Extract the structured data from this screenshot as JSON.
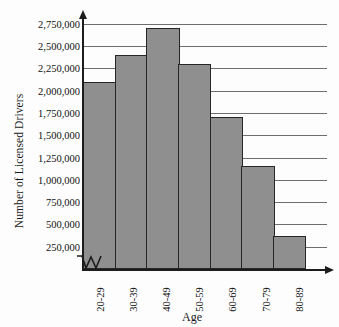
{
  "chart_data": {
    "type": "bar",
    "title": "",
    "xlabel": "Age",
    "ylabel": "Number of Licensed Drivers",
    "categories": [
      "20-29",
      "30-39",
      "40-49",
      "50-59",
      "60-69",
      "70-79",
      "80-89"
    ],
    "values": [
      2100000,
      2400000,
      2700000,
      2300000,
      1700000,
      1150000,
      375000
    ],
    "ytick_labels": [
      "2,750,000",
      "2,500,000",
      "2,250,000",
      "2,000,000",
      "1,750,000",
      "1,500,000",
      "1,250,000",
      "1,000,000",
      "750,000",
      "500,000",
      "250,000"
    ],
    "ytick_values": [
      2750000,
      2500000,
      2250000,
      2000000,
      1750000,
      1500000,
      1250000,
      1000000,
      750000,
      500000,
      250000
    ],
    "ylim": [
      0,
      2860000
    ],
    "ytick_step": 250000,
    "grid": true,
    "legend": "none",
    "axis_break": true,
    "bar_color": "#8f8f8f",
    "bar_edge_color": "#262626",
    "gridline_color": "#6e6e6e",
    "axis_color": "#1c1c1c"
  }
}
